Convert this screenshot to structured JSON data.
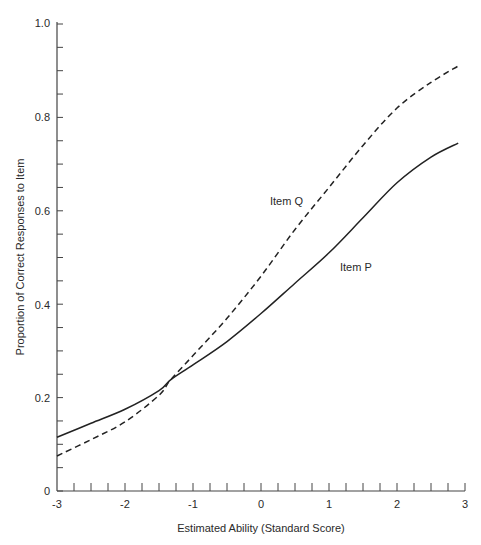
{
  "chart_data": {
    "type": "line",
    "title": "",
    "xlabel": "Estimated Ability (Standard Score)",
    "ylabel": "Proportion of Correct Responses to Item",
    "xlim": [
      -3,
      3
    ],
    "ylim": [
      0,
      1.0
    ],
    "x_ticks": [
      "-3",
      "-2",
      "-1",
      "0",
      "1",
      "2",
      "3"
    ],
    "y_ticks": [
      "0",
      "0.2",
      "0.4",
      "0.6",
      "0.8",
      "1.0"
    ],
    "x_minor_tick_step": 0.25,
    "y_minor_tick_step": 0.05,
    "grid": false,
    "legend": "none (direct labels on curves)",
    "x": [
      -3,
      -2.5,
      -2,
      -1.5,
      -1.33,
      -1,
      -0.5,
      0,
      0.5,
      1,
      1.5,
      2,
      2.5,
      2.9
    ],
    "series": [
      {
        "name": "Item P",
        "style": "solid",
        "values": [
          0.115,
          0.145,
          0.175,
          0.215,
          0.238,
          0.27,
          0.32,
          0.38,
          0.445,
          0.51,
          0.585,
          0.66,
          0.715,
          0.745
        ]
      },
      {
        "name": "Item Q",
        "style": "dashed",
        "values": [
          0.075,
          0.11,
          0.148,
          0.205,
          0.238,
          0.29,
          0.37,
          0.46,
          0.56,
          0.65,
          0.74,
          0.82,
          0.875,
          0.91
        ]
      }
    ],
    "annotations": [
      {
        "text": "Item Q",
        "x": 0.1,
        "y": 0.61
      },
      {
        "text": "Item P",
        "x": 1.05,
        "y": 0.48
      }
    ]
  },
  "labels": {
    "xlabel": "Estimated Ability (Standard Score)",
    "ylabel": "Proportion of Correct Responses to Item",
    "item_q": "Item Q",
    "item_p": "Item P",
    "xt0": "-3",
    "xt1": "-2",
    "xt2": "-1",
    "xt3": "0",
    "xt4": "1",
    "xt5": "2",
    "xt6": "3",
    "yt0": "0",
    "yt1": "0.2",
    "yt2": "0.4",
    "yt3": "0.6",
    "yt4": "0.8",
    "yt5": "1.0"
  }
}
